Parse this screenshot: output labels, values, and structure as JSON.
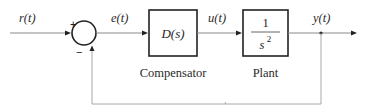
{
  "diagram": {
    "type": "feedback-control-block-diagram",
    "signals": {
      "reference": "r(t)",
      "error": "e(t)",
      "control": "u(t)",
      "output": "y(t)"
    },
    "summing_junction": {
      "plus_sign": "+",
      "minus_sign": "−"
    },
    "blocks": [
      {
        "id": "compensator",
        "transfer_function": "D(s)",
        "caption": "Compensator"
      },
      {
        "id": "plant",
        "numerator": "1",
        "denominator_base": "s",
        "denominator_exponent": "2",
        "caption": "Plant"
      }
    ],
    "feedback": "unity negative feedback from y(t) to summing junction"
  }
}
